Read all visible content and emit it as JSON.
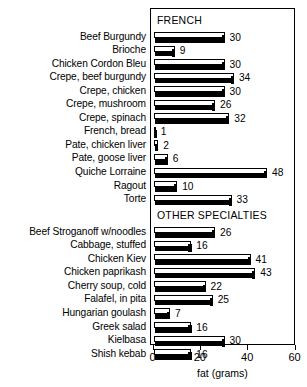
{
  "chart_data": {
    "type": "bar",
    "orientation": "horizontal",
    "title": "",
    "xlabel": "fat (grams)",
    "ylabel": "",
    "xlim": [
      0,
      60
    ],
    "xticks": [
      0,
      20,
      40,
      60
    ],
    "xtick_labels": [
      "0",
      "20",
      "40",
      "60"
    ],
    "grid": false,
    "legend": "none",
    "value_labels": true,
    "groups": [
      {
        "name": "FRENCH",
        "categories": [
          "Beef Burgundy",
          "Brioche",
          "Chicken Cordon Bleu",
          "Crepe, beef burgundy",
          "Crepe, chicken",
          "Crepe, mushroom",
          "Crepe, spinach",
          "French, bread",
          "Pate, chicken liver",
          "Pate, goose liver",
          "Quiche Lorraine",
          "Ragout",
          "Torte"
        ],
        "values": [
          30,
          9,
          30,
          34,
          30,
          26,
          32,
          1,
          2,
          6,
          48,
          10,
          33
        ]
      },
      {
        "name": "OTHER SPECIALTIES",
        "categories": [
          "Beef Stroganoff w/noodles",
          "Cabbage, stuffed",
          "Chicken Kiev",
          "Chicken paprikash",
          "Cherry soup, cold",
          "Falafel, in pita",
          "Hungarian goulash",
          "Greek salad",
          "Kielbasa",
          "Shish kebab"
        ],
        "values": [
          26,
          16,
          41,
          43,
          22,
          25,
          7,
          16,
          30,
          16
        ]
      }
    ],
    "categories": [
      "Beef Burgundy",
      "Brioche",
      "Chicken Cordon Bleu",
      "Crepe, beef burgundy",
      "Crepe, chicken",
      "Crepe, mushroom",
      "Crepe, spinach",
      "French, bread",
      "Pate, chicken liver",
      "Pate, goose liver",
      "Quiche Lorraine",
      "Ragout",
      "Torte",
      "Beef Stroganoff w/noodles",
      "Cabbage, stuffed",
      "Chicken Kiev",
      "Chicken paprikash",
      "Cherry soup, cold",
      "Falafel, in pita",
      "Hungarian goulash",
      "Greek salad",
      "Kielbasa",
      "Shish kebab"
    ],
    "values": [
      30,
      9,
      30,
      34,
      30,
      26,
      32,
      1,
      2,
      6,
      48,
      10,
      33,
      26,
      16,
      41,
      43,
      22,
      25,
      7,
      16,
      30,
      16
    ],
    "colors": {
      "bar_outline": "#000000",
      "bar_fill_top": "#ffffff",
      "bar_fill_bottom": "#000000",
      "axis": "#000000",
      "text": "#000000",
      "background": "#ffffff"
    }
  }
}
